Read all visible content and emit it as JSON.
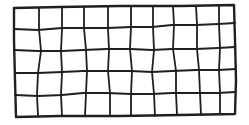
{
  "drawing": {
    "description": "Hand-drawn grid of 5 rows by 10 columns",
    "rows": 5,
    "cols": 10,
    "stroke_color": "#1f1f1f",
    "outer_stroke_width": 2.4,
    "inner_stroke_width": 1.8,
    "background": "#ffffff",
    "outer_border": [
      [
        14,
        8
      ],
      [
        60,
        7
      ],
      [
        120,
        6
      ],
      [
        180,
        6
      ],
      [
        234,
        5
      ],
      [
        235,
        40
      ],
      [
        236,
        80
      ],
      [
        235,
        114
      ],
      [
        180,
        115
      ],
      [
        120,
        116
      ],
      [
        60,
        116
      ],
      [
        16,
        117
      ],
      [
        15,
        80
      ],
      [
        14,
        40
      ],
      [
        14,
        8
      ]
    ],
    "horizontal_lines": [
      [
        [
          14,
          29
        ],
        [
          38,
          30
        ],
        [
          62,
          28
        ],
        [
          83,
          28
        ],
        [
          107,
          28
        ],
        [
          131,
          27
        ],
        [
          152,
          27
        ],
        [
          172,
          25
        ],
        [
          196,
          25
        ],
        [
          218,
          24
        ],
        [
          235,
          23
        ]
      ],
      [
        [
          14,
          50
        ],
        [
          38,
          51
        ],
        [
          62,
          51
        ],
        [
          83,
          50
        ],
        [
          107,
          49
        ],
        [
          131,
          49
        ],
        [
          152,
          50
        ],
        [
          172,
          49
        ],
        [
          196,
          49
        ],
        [
          218,
          48
        ],
        [
          235,
          47
        ]
      ],
      [
        [
          15,
          73
        ],
        [
          38,
          73
        ],
        [
          62,
          72
        ],
        [
          83,
          71
        ],
        [
          107,
          71
        ],
        [
          131,
          71
        ],
        [
          152,
          72
        ],
        [
          172,
          71
        ],
        [
          196,
          70
        ],
        [
          218,
          70
        ],
        [
          236,
          69
        ]
      ],
      [
        [
          15,
          95
        ],
        [
          38,
          96
        ],
        [
          62,
          95
        ],
        [
          83,
          93
        ],
        [
          107,
          93
        ],
        [
          131,
          94
        ],
        [
          152,
          94
        ],
        [
          172,
          93
        ],
        [
          196,
          93
        ],
        [
          218,
          93
        ],
        [
          235,
          92
        ]
      ]
    ],
    "vertical_lines": [
      [
        [
          39,
          8
        ],
        [
          39,
          29
        ],
        [
          41,
          51
        ],
        [
          38,
          73
        ],
        [
          37,
          95
        ],
        [
          38,
          116
        ]
      ],
      [
        [
          62,
          7
        ],
        [
          62,
          29
        ],
        [
          61,
          51
        ],
        [
          62,
          72
        ],
        [
          61,
          95
        ],
        [
          62,
          116
        ]
      ],
      [
        [
          84,
          7
        ],
        [
          84,
          28
        ],
        [
          86,
          50
        ],
        [
          87,
          71
        ],
        [
          86,
          93
        ],
        [
          85,
          116
        ]
      ],
      [
        [
          108,
          7
        ],
        [
          108,
          28
        ],
        [
          109,
          50
        ],
        [
          108,
          71
        ],
        [
          110,
          93
        ],
        [
          110,
          116
        ]
      ],
      [
        [
          131,
          6
        ],
        [
          131,
          27
        ],
        [
          130,
          49
        ],
        [
          132,
          71
        ],
        [
          131,
          94
        ],
        [
          131,
          116
        ]
      ],
      [
        [
          153,
          6
        ],
        [
          153,
          27
        ],
        [
          154,
          50
        ],
        [
          152,
          72
        ],
        [
          154,
          94
        ],
        [
          155,
          116
        ]
      ],
      [
        [
          173,
          6
        ],
        [
          174,
          25
        ],
        [
          173,
          49
        ],
        [
          176,
          71
        ],
        [
          176,
          93
        ],
        [
          177,
          115
        ]
      ],
      [
        [
          196,
          6
        ],
        [
          197,
          25
        ],
        [
          197,
          49
        ],
        [
          199,
          70
        ],
        [
          200,
          93
        ],
        [
          201,
          115
        ]
      ],
      [
        [
          219,
          5
        ],
        [
          219,
          24
        ],
        [
          220,
          48
        ],
        [
          219,
          70
        ],
        [
          220,
          93
        ],
        [
          220,
          114
        ]
      ]
    ]
  }
}
